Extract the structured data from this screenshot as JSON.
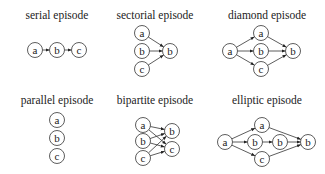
{
  "panels": [
    {
      "id": "serial",
      "title": "serial episode",
      "title_pos": [
        57,
        19
      ],
      "nodes": [
        {
          "label": "a",
          "x": 35,
          "y": 50
        },
        {
          "label": "b",
          "x": 57,
          "y": 50
        },
        {
          "label": "c",
          "x": 79,
          "y": 50
        }
      ],
      "edges": [
        [
          0,
          1
        ],
        [
          1,
          2
        ]
      ]
    },
    {
      "id": "sectorial",
      "title": "sectorial episode",
      "title_pos": [
        155,
        19
      ],
      "nodes": [
        {
          "label": "a",
          "x": 142,
          "y": 33
        },
        {
          "label": "b",
          "x": 142,
          "y": 51
        },
        {
          "label": "c",
          "x": 142,
          "y": 69
        },
        {
          "label": "b",
          "x": 170,
          "y": 51
        }
      ],
      "edges": [
        [
          0,
          3
        ],
        [
          1,
          3
        ],
        [
          2,
          3
        ]
      ]
    },
    {
      "id": "diamond",
      "title": "diamond episode",
      "title_pos": [
        267,
        19
      ],
      "nodes": [
        {
          "label": "a",
          "x": 230,
          "y": 51
        },
        {
          "label": "a",
          "x": 261,
          "y": 33
        },
        {
          "label": "b",
          "x": 261,
          "y": 51
        },
        {
          "label": "c",
          "x": 261,
          "y": 69
        },
        {
          "label": "b",
          "x": 293,
          "y": 51
        }
      ],
      "edges": [
        [
          0,
          1
        ],
        [
          0,
          2
        ],
        [
          0,
          3
        ],
        [
          1,
          4
        ],
        [
          2,
          4
        ],
        [
          3,
          4
        ]
      ]
    },
    {
      "id": "parallel",
      "title": "parallel episode",
      "title_pos": [
        57,
        104
      ],
      "nodes": [
        {
          "label": "a",
          "x": 57,
          "y": 120
        },
        {
          "label": "b",
          "x": 57,
          "y": 138
        },
        {
          "label": "c",
          "x": 57,
          "y": 156
        }
      ],
      "edges": []
    },
    {
      "id": "bipartite",
      "title": "bipartite episode",
      "title_pos": [
        155,
        104
      ],
      "nodes": [
        {
          "label": "a",
          "x": 143,
          "y": 125
        },
        {
          "label": "b",
          "x": 143,
          "y": 141
        },
        {
          "label": "c",
          "x": 143,
          "y": 158
        },
        {
          "label": "b",
          "x": 172,
          "y": 131
        },
        {
          "label": "c",
          "x": 172,
          "y": 149
        }
      ],
      "edges": [
        [
          0,
          3
        ],
        [
          0,
          4
        ],
        [
          1,
          3
        ],
        [
          1,
          4
        ],
        [
          2,
          3
        ],
        [
          2,
          4
        ]
      ]
    },
    {
      "id": "elliptic",
      "title": "elliptic episode",
      "title_pos": [
        267,
        104
      ],
      "nodes": [
        {
          "label": "a",
          "x": 225,
          "y": 142
        },
        {
          "label": "a",
          "x": 262,
          "y": 125
        },
        {
          "label": "b",
          "x": 255,
          "y": 142
        },
        {
          "label": "b",
          "x": 280,
          "y": 142
        },
        {
          "label": "c",
          "x": 262,
          "y": 159
        },
        {
          "label": "b",
          "x": 308,
          "y": 142
        }
      ],
      "edges": [
        [
          0,
          1
        ],
        [
          0,
          2
        ],
        [
          0,
          4
        ],
        [
          2,
          3
        ],
        [
          1,
          5
        ],
        [
          3,
          5
        ],
        [
          4,
          5
        ]
      ]
    }
  ],
  "style": {
    "node_radius": 7.5,
    "stroke_color": "#333333",
    "text_color": "#222222",
    "background": "#ffffff"
  }
}
